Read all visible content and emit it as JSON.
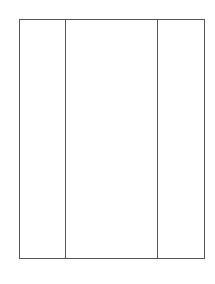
{
  "diagram": {
    "type": "three-column-frame",
    "stroke_color": "#555555",
    "background_color": "#ffffff",
    "panels": [
      {
        "id": "left",
        "label": ""
      },
      {
        "id": "center",
        "label": ""
      },
      {
        "id": "right",
        "label": ""
      }
    ]
  }
}
